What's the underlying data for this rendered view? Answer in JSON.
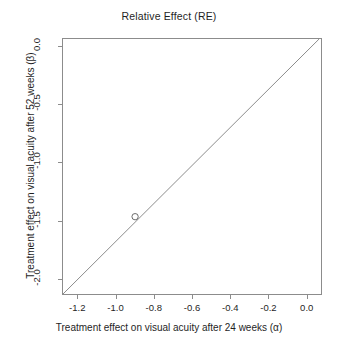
{
  "chart_data": {
    "type": "scatter",
    "title": "Relative Effect (RE)",
    "xlabel": "Treatment effect on visual acuity after 24 weeks (α)",
    "ylabel": "Treatment effect on visual acuity after 52 weeks  (β)",
    "xlim": [
      -1.28,
      0.08
    ],
    "ylim": [
      -2.14,
      0.07
    ],
    "xticks": [
      -1.2,
      -1.0,
      -0.8,
      -0.6,
      -0.4,
      -0.2,
      0.0
    ],
    "xticklabels": [
      "-1.2",
      "-1.0",
      "-0.8",
      "-0.6",
      "-0.4",
      "-0.2",
      "0.0"
    ],
    "yticks": [
      -2.0,
      -1.5,
      -1.0,
      -0.5,
      0.0
    ],
    "yticklabels": [
      "-2.0",
      "-1.5",
      "-1.0",
      "-0.5",
      "0.0"
    ],
    "grid": false,
    "legend": null,
    "series": [
      {
        "name": "identity-line",
        "type": "line",
        "x": [
          -1.28,
          0.07
        ],
        "y": [
          -2.14,
          0.07
        ],
        "color": "#6e6e6e",
        "width": 0.8
      },
      {
        "name": "estimate-point",
        "type": "scatter",
        "marker": "open-circle",
        "x": [
          -0.9
        ],
        "y": [
          -1.47
        ],
        "color": "#5a5a5a",
        "size": 3.2
      }
    ],
    "annotations": []
  },
  "figure": {
    "background": "#ffffff",
    "axis_color": "#8c8c8c",
    "text_color": "#1f1f1f"
  }
}
